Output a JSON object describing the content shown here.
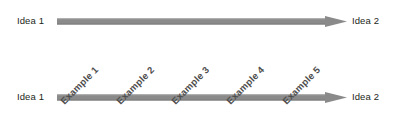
{
  "diagram": {
    "background_color": "#ffffff",
    "arrow_color": "#8a8a8a",
    "arrow_edge_color": "#7a7a7a",
    "text_color": "#231f20",
    "example_text_color": "#4d4d4d",
    "rows": [
      {
        "name": "plain-arrow-row",
        "left_label": "Idea 1",
        "right_label": "Idea 2",
        "examples": []
      },
      {
        "name": "example-arrow-row",
        "left_label": "Idea 1",
        "right_label": "Idea 2",
        "examples": [
          {
            "label": "Example 1",
            "x": 62
          },
          {
            "label": "Example 2",
            "x": 118
          },
          {
            "label": "Example 3",
            "x": 173
          },
          {
            "label": "Example 4",
            "x": 228
          },
          {
            "label": "Example 5",
            "x": 284
          }
        ]
      }
    ]
  }
}
